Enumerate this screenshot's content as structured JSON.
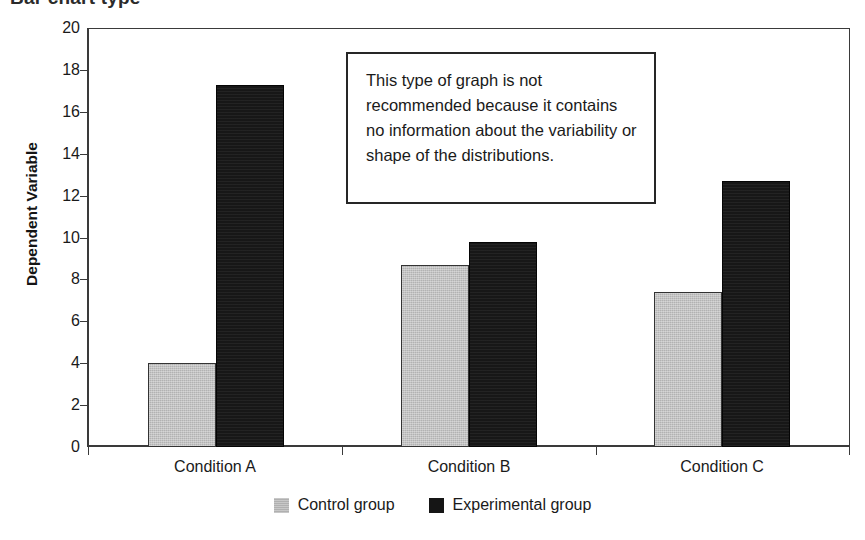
{
  "chart_data": {
    "type": "bar",
    "title": "Bar chart type",
    "xlabel": "",
    "ylabel": "Dependent Variable",
    "ylim": [
      0,
      20
    ],
    "ytick_step": 2,
    "yticks": [
      "20",
      "18",
      "16",
      "14",
      "12",
      "10",
      "8",
      "6",
      "4",
      "2",
      "0"
    ],
    "categories": [
      "Condition A",
      "Condition B",
      "Condition C"
    ],
    "grid": false,
    "legend_position": "bottom-center",
    "series": [
      {
        "name": "Control group",
        "color": "#b2b2b2",
        "values": [
          4.0,
          8.7,
          7.4
        ]
      },
      {
        "name": "Experimental group",
        "color": "#171717",
        "values": [
          17.3,
          9.8,
          12.7
        ]
      }
    ],
    "annotations": [
      {
        "id": "caution-note",
        "text": "This type of graph is not recommended because it contains no information about the variability or shape of the distributions."
      }
    ]
  },
  "axis": {
    "y_title": "Dependent Variable"
  },
  "legend": {
    "items": [
      {
        "label": "Control group",
        "swatch": "control-swatch-icon"
      },
      {
        "label": "Experimental group",
        "swatch": "experimental-swatch-icon"
      }
    ]
  },
  "annotation_box": {
    "text": "This type of graph is not recommended because it contains no information about the variability or shape of the distributions."
  }
}
